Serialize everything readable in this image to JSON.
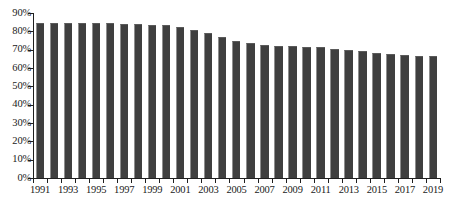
{
  "chart_data": {
    "type": "bar",
    "title": "",
    "subtitle": "",
    "xlabel": "",
    "ylabel": "",
    "categories": [
      "1991",
      "1992",
      "1993",
      "1994",
      "1995",
      "1996",
      "1997",
      "1998",
      "1999",
      "2000",
      "2001",
      "2002",
      "2003",
      "2004",
      "2005",
      "2006",
      "2007",
      "2008",
      "2009",
      "2010",
      "2011",
      "2012",
      "2013",
      "2014",
      "2015",
      "2016",
      "2017",
      "2018",
      "2019"
    ],
    "values": [
      84.5,
      84.6,
      84.5,
      84.5,
      84.4,
      84.3,
      84.2,
      84.0,
      83.6,
      83.2,
      82.4,
      81.0,
      79.2,
      77.0,
      75.0,
      73.4,
      72.6,
      72.2,
      71.9,
      71.6,
      71.2,
      70.6,
      70.0,
      69.2,
      68.4,
      67.6,
      67.0,
      66.7,
      66.6
    ],
    "ylim": [
      0,
      90
    ],
    "ytick_values": [
      0,
      10,
      20,
      30,
      40,
      50,
      60,
      70,
      80,
      90
    ],
    "ytick_labels": [
      "0%",
      "10%",
      "20%",
      "30%",
      "40%",
      "50%",
      "60%",
      "70%",
      "80%",
      "90%"
    ],
    "xtick_labels": [
      "1991",
      "1993",
      "1995",
      "1997",
      "1999",
      "2001",
      "2003",
      "2005",
      "2007",
      "2009",
      "2011",
      "2013",
      "2015",
      "2017",
      "2019"
    ],
    "xtick_label_step": 2,
    "grid": false,
    "legend": false,
    "legend_position": "none",
    "series": [
      {
        "name": "",
        "color": "#3f3f3f",
        "values": [
          84.5,
          84.6,
          84.5,
          84.5,
          84.4,
          84.3,
          84.2,
          84.0,
          83.6,
          83.2,
          82.4,
          81.0,
          79.2,
          77.0,
          75.0,
          73.4,
          72.6,
          72.2,
          71.9,
          71.6,
          71.2,
          70.6,
          70.0,
          69.2,
          68.4,
          67.6,
          67.0,
          66.7,
          66.6
        ]
      }
    ],
    "colors": {
      "bar_fill": "#3f3f3f",
      "bar_highlight": "#8e8e8e",
      "axis": "#1f1f1f",
      "text": "#1a1a1a",
      "background": "#ffffff"
    }
  }
}
